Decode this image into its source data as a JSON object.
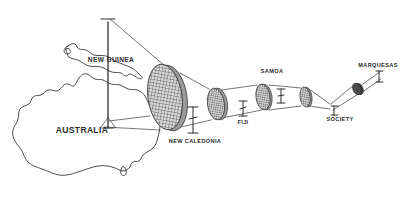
{
  "figure": {
    "background_color": "#ffffff",
    "ink_color": "#3a3a3a",
    "label_color": "#2b2b2b"
  },
  "landmasses": [
    {
      "id": "australia",
      "label": "AUSTRALIA",
      "label_x": 82,
      "label_y": 133
    },
    {
      "id": "new-guinea",
      "label": "NEW GUINEA",
      "label_x": 111,
      "label_y": 62
    }
  ],
  "island_groups": [
    {
      "id": "new-caledonia",
      "label": "NEW CALEDONIA",
      "label_x": 195,
      "label_y": 143,
      "disc_cx": 165,
      "disc_cy": 97,
      "disc_rx": 17,
      "disc_ry": 33,
      "fill": "#8a8a8a",
      "marker_x": 193,
      "marker_y": 120,
      "marker_len": 26
    },
    {
      "id": "fiji",
      "label": "FIJI",
      "label_x": 243,
      "label_y": 124,
      "disc_cx": 216,
      "disc_cy": 104,
      "disc_rx": 8.5,
      "disc_ry": 16,
      "fill": "#8a8a8a",
      "marker_x": 242,
      "marker_y": 109,
      "marker_len": 14
    },
    {
      "id": "samoa",
      "label": "SAMOA",
      "label_x": 272,
      "label_y": 73,
      "disc_cx": 263,
      "disc_cy": 97,
      "disc_rx": 7,
      "disc_ry": 13,
      "fill": "#8a8a8a",
      "marker_x": 281,
      "marker_y": 97,
      "marker_len": 12
    },
    {
      "id": "society",
      "label": "SOCIETY",
      "label_x": 340,
      "label_y": 121,
      "disc_cx": 305,
      "disc_cy": 97,
      "disc_rx": 5,
      "disc_ry": 10,
      "fill": "#8a8a8a",
      "marker_x": 332,
      "marker_y": 108,
      "marker_len": 10
    },
    {
      "id": "marquesas",
      "label": "MARQUESAS",
      "label_x": 378,
      "label_y": 67,
      "disc_cx": 357,
      "disc_cy": 89,
      "disc_rx": 4,
      "disc_ry": 6,
      "fill": "#4a4a4a",
      "marker_x": 377,
      "marker_y": 78,
      "marker_len": 9
    }
  ],
  "axis": {
    "id": "vertical-axis",
    "x": 108,
    "top_y": 18,
    "bottom_y": 128,
    "arrow": true,
    "cap_half_width": 7
  }
}
